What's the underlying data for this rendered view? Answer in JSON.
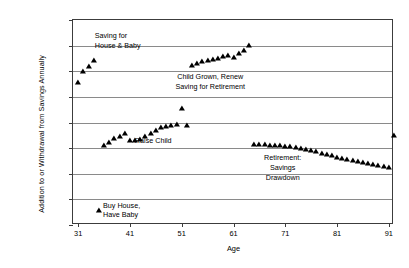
{
  "chart_data": {
    "type": "scatter",
    "title": "",
    "xlabel": "Age",
    "ylabel": "Addition to or Withdrawal from Savings Annually",
    "xlim": [
      30,
      92
    ],
    "ylim": [
      -20000,
      20000
    ],
    "grid": true,
    "legend": "none",
    "xticks": [
      "31",
      "41",
      "51",
      "61",
      "71",
      "81",
      "91"
    ],
    "xtick_values": [
      31,
      41,
      51,
      61,
      71,
      81,
      91
    ],
    "yticks": [
      "$20,000",
      "$15,000",
      "$10,000",
      "$5,000",
      "$0",
      "-$5,000",
      "-$10,000",
      "-$15,000",
      "-$20,000"
    ],
    "ytick_values": [
      20000,
      15000,
      10000,
      5000,
      0,
      -5000,
      -10000,
      -15000,
      -20000
    ],
    "series": [
      {
        "name": "Addition to or Withdrawal from Savings Annually",
        "x": [
          31,
          32,
          33,
          34,
          35,
          36,
          37,
          38,
          39,
          40,
          41,
          42,
          43,
          44,
          45,
          46,
          47,
          48,
          49,
          50,
          51,
          52,
          53,
          54,
          55,
          56,
          57,
          58,
          59,
          60,
          61,
          62,
          63,
          64,
          65,
          66,
          67,
          68,
          69,
          70,
          71,
          72,
          73,
          74,
          75,
          76,
          77,
          78,
          79,
          80,
          81,
          82,
          83,
          84,
          85,
          86,
          87,
          88,
          89,
          90,
          91,
          92
        ],
        "y": [
          8000,
          10000,
          11000,
          12200,
          -17000,
          -4400,
          -3800,
          -3100,
          -2600,
          -2100,
          -3500,
          -3400,
          -3300,
          -2700,
          -2100,
          -1500,
          -900,
          -600,
          -400,
          -300,
          2900,
          -400,
          11200,
          11600,
          12000,
          12200,
          12400,
          12600,
          12900,
          13100,
          12800,
          13500,
          14200,
          15100,
          -4200,
          -4200,
          -4250,
          -4300,
          -4350,
          -4400,
          -4500,
          -4600,
          -4750,
          -4900,
          -5100,
          -5350,
          -5600,
          -5900,
          -6150,
          -6400,
          -6650,
          -6900,
          -7150,
          -7350,
          -7550,
          -7750,
          -7950,
          -8150,
          -8350,
          -8550,
          -8600,
          -2500
        ]
      }
    ],
    "annotations": [
      {
        "id": "saving-house-baby",
        "text_lines": [
          "Saving for",
          "House & Baby"
        ],
        "x": 34.2,
        "y": 16800,
        "align": "left"
      },
      {
        "id": "child-grown-retirement",
        "text_lines": [
          "Child Grown, Renew",
          "Saving for Retirement"
        ],
        "x": 56.5,
        "y": 8800,
        "align": "center"
      },
      {
        "id": "raise-child",
        "text_lines": [
          "Raise Child"
        ],
        "x": 45.5,
        "y": -3700,
        "align": "center"
      },
      {
        "id": "retirement-drawdown",
        "text_lines": [
          "Retirement:",
          "Savings",
          "Drawdown"
        ],
        "x": 70.5,
        "y": -7000,
        "align": "center"
      },
      {
        "id": "buy-house-have-baby",
        "text_lines": [
          "Buy House,",
          "Have Baby"
        ],
        "x": 35.8,
        "y": -16200,
        "align": "left"
      }
    ]
  }
}
